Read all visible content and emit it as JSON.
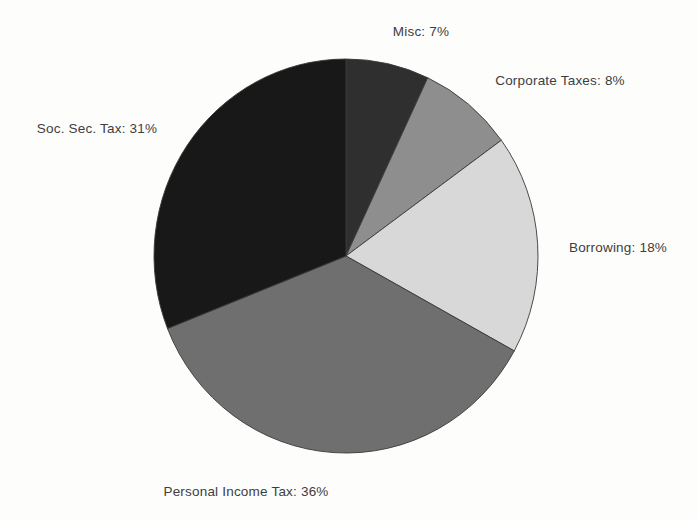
{
  "figure": {
    "background": "#fdfdfc",
    "text_color": "#3e3e3e"
  },
  "chart_data": {
    "type": "pie",
    "title": "",
    "legend": "none",
    "start_angle_deg": 0,
    "direction": "clockwise",
    "edge_color": "#3a3a3a",
    "geometry": {
      "cx": 346,
      "cy": 256,
      "rx": 192,
      "ry": 197
    },
    "categories": [
      "Misc",
      "Corporate Taxes",
      "Borrowing",
      "Personal Income Tax",
      "Soc. Sec. Tax"
    ],
    "values": [
      7,
      8,
      18,
      36,
      31
    ],
    "slices": [
      {
        "name": "Misc",
        "value": 7,
        "label": "Misc: 7%",
        "color": "#2f2f2f",
        "label_x": 421,
        "label_y": 31
      },
      {
        "name": "Corporate Taxes",
        "value": 8,
        "label": "Corporate Taxes: 8%",
        "color": "#8e8e8e",
        "label_x": 560,
        "label_y": 80
      },
      {
        "name": "Borrowing",
        "value": 18,
        "label": "Borrowing: 18%",
        "color": "#d8d8d8",
        "label_x": 618,
        "label_y": 247
      },
      {
        "name": "Personal Income Tax",
        "value": 36,
        "label": "Personal Income Tax: 36%",
        "color": "#6f6f6f",
        "label_x": 246,
        "label_y": 491
      },
      {
        "name": "Soc. Sec. Tax",
        "value": 31,
        "label": "Soc. Sec. Tax: 31%",
        "color": "#181818",
        "label_x": 97,
        "label_y": 128
      }
    ]
  }
}
